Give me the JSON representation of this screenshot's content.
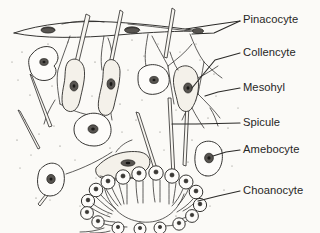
{
  "figure": {
    "background_color": "#fbfaf7",
    "ink_color": "#2b2a28",
    "text_color": "#272726",
    "labels": [
      {
        "id": "pinacocyte",
        "text": "Pinacocyte",
        "text_x": 243,
        "text_y": 23,
        "leader_points": "240,21 212,25 186,29",
        "leader_points_2": "240,21 214,33 192,34",
        "description": "Flattened epithelial cell of the outer pinacoderm layer"
      },
      {
        "id": "collencyte",
        "text": "Collencyte",
        "text_x": 243,
        "text_y": 56,
        "leader_points": "240,53 215,60 192,88",
        "description": "Collagen-secreting stellate cell in the mesohyl"
      },
      {
        "id": "mesohyl",
        "text": "Mesohyl",
        "text_x": 243,
        "text_y": 91,
        "leader_points": "240,88 218,92 205,96",
        "description": "Gelatinous stippled matrix between cell layers"
      },
      {
        "id": "spicule",
        "text": "Spicule",
        "text_x": 243,
        "text_y": 126,
        "leader_points": "240,123 196,124 172,124",
        "description": "Needle-like skeletal element"
      },
      {
        "id": "amebocyte",
        "text": "Amebocyte",
        "text_x": 243,
        "text_y": 153,
        "leader_points": "240,150 226,152 213,156",
        "description": "Motile totipotent cell wandering in the mesohyl"
      },
      {
        "id": "choanocyte",
        "text": "Choanocyte",
        "text_x": 243,
        "text_y": 194,
        "leader_points": "240,191 218,196 198,201",
        "description": "Flagellated collar cell lining the internal chamber"
      }
    ],
    "structures": {
      "pinacoderm_layer": "Flattened cells forming the top surface band",
      "choanocyte_chamber": "U-shaped arc of collar cells at lower centre",
      "choanocyte_count": 17,
      "spicule_count": 9,
      "amebocyte_count": 7
    }
  }
}
